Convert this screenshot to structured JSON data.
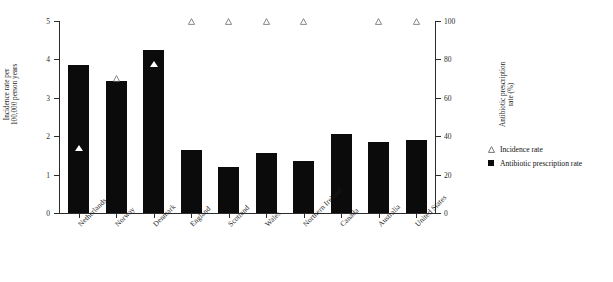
{
  "chart_data": {
    "type": "bar",
    "title": "",
    "categories": [
      "Netherlands",
      "Norway",
      "Denmark",
      "England",
      "Scotland",
      "Wales",
      "Northern Ireland",
      "Canada",
      "Australia",
      "United States"
    ],
    "series": [
      {
        "name": "Antibiotic prescription rate",
        "axis": "right",
        "unit": "%",
        "marker": "filled-square",
        "color": "#0b0b0b",
        "values": [
          77,
          69,
          85,
          33,
          24,
          31,
          27,
          41,
          37,
          38
        ]
      },
      {
        "name": "Incidence rate",
        "axis": "left",
        "unit": "per 100,000 person years",
        "marker": "open-triangle",
        "color": "#555555",
        "values": [
          1.6,
          3.4,
          3.8,
          4.9,
          4.9,
          4.9,
          4.9,
          null,
          4.9,
          4.9
        ]
      }
    ],
    "xlabel": "",
    "ylabel": "Incidence rate per\n100,000 person years",
    "y2label": "Antibiotic prescription\nrate (%)",
    "ylim": [
      0,
      5
    ],
    "y2lim": [
      0,
      100
    ],
    "yticks": [
      "5",
      "4",
      "3",
      "2",
      "1",
      "0"
    ],
    "y2ticks": [
      "100",
      "80",
      "60",
      "40",
      "20",
      "0"
    ],
    "grid": false,
    "legend_position": "right"
  },
  "axes": {
    "left_title": "Incidence rate per\n100,000 person years",
    "right_title": "Antibiotic prescription\nrate (%)",
    "left_ticks": [
      "5",
      "4",
      "3",
      "2",
      "1",
      "0"
    ],
    "right_ticks": [
      "100",
      "80",
      "60",
      "40",
      "20",
      "0"
    ]
  },
  "legend": {
    "items": [
      {
        "label": "Incidence rate",
        "marker": "open-triangle"
      },
      {
        "label": "Antibiotic prescription rate",
        "marker": "filled-square"
      }
    ]
  }
}
